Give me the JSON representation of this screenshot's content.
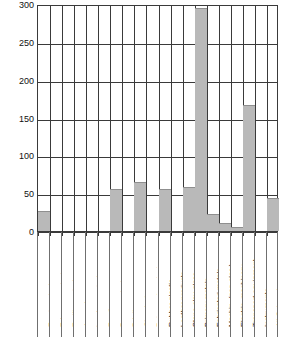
{
  "chart_data": {
    "type": "bar",
    "title": "",
    "subtitle": "",
    "xlabel": "",
    "ylabel": "",
    "ylim": [
      0,
      300
    ],
    "yticks": [
      0,
      50,
      100,
      150,
      200,
      250,
      300
    ],
    "grid": true,
    "legend": "none",
    "orientation": "vertical",
    "bar_color": "#b9b9b9",
    "categories": [
      "Food products",
      "Tobacco products",
      "Textile products",
      "Apparel",
      "Lumber products",
      "Furniture",
      "Paper products",
      "Printing",
      "Chemicals",
      "Petro-coal products",
      "Rubber-plastic",
      "Leather products",
      "Stone-clay-glass",
      "Primary metals",
      "Fabricated metals",
      "Machin. (non-elec.)",
      "Electric. machinery",
      "Transport equipment",
      "Instruments",
      "All Categories"
    ],
    "values": [
      26,
      0,
      0,
      0,
      0,
      0,
      55,
      0,
      65,
      0,
      55,
      0,
      58,
      295,
      22,
      10,
      5,
      167,
      0,
      44
    ]
  },
  "axis": {
    "y_tick_labels": [
      "300",
      "250",
      "200",
      "150",
      "100",
      "50",
      "0"
    ]
  }
}
